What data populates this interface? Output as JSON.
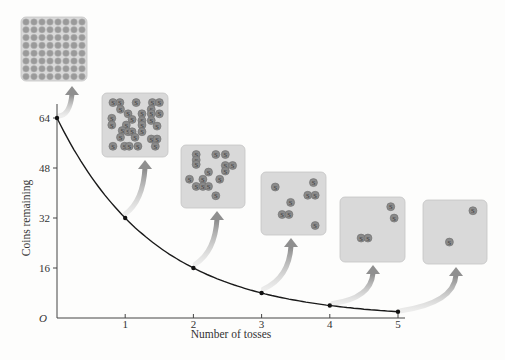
{
  "chart_data": {
    "type": "line",
    "title": "",
    "xlabel": "Number of tosses",
    "ylabel": "Coins remaining",
    "x": [
      0,
      1,
      2,
      3,
      4,
      5
    ],
    "series": [
      {
        "name": "Coins remaining",
        "values": [
          64,
          32,
          16,
          8,
          4,
          2
        ]
      }
    ],
    "xticks": [
      "1",
      "2",
      "3",
      "4",
      "5"
    ],
    "yticks": [
      "16",
      "32",
      "48",
      "64"
    ],
    "origin_label": "O",
    "xlim": [
      0,
      5.2
    ],
    "ylim": [
      0,
      68
    ],
    "grid": false,
    "legend": null,
    "annotations": [
      {
        "x": 0,
        "coins": 64,
        "panel": "grid of 64 coins"
      },
      {
        "x": 1,
        "coins": 32,
        "panel": "32 coins scattered"
      },
      {
        "x": 2,
        "coins": 16,
        "panel": "16 coins scattered"
      },
      {
        "x": 3,
        "coins": 8,
        "panel": "8 coins scattered"
      },
      {
        "x": 4,
        "coins": 4,
        "panel": "4 coins scattered"
      },
      {
        "x": 5,
        "coins": 2,
        "panel": "2 coins scattered"
      }
    ]
  },
  "colors": {
    "curve": "#1a1a1a",
    "axis": "#444444",
    "panel_fill": "#d9d9d9",
    "panel_border": "#c4c4c4",
    "coin": "#8a8a8a",
    "arrow": "#8f8f8f"
  }
}
